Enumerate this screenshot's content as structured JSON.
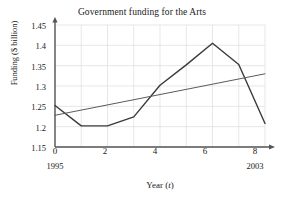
{
  "chart_data": {
    "type": "line",
    "title": "Government funding for the Arts",
    "xlabel": "Year (t)",
    "xlabel_plain": "Year",
    "xlabel_variable": "t",
    "ylabel": "Funding ($ billion)",
    "xlim": [
      0,
      8
    ],
    "ylim": [
      1.15,
      1.45
    ],
    "xticks": [
      0,
      2,
      4,
      6,
      8
    ],
    "xtick_labels": [
      "0",
      "2",
      "4",
      "6",
      "8"
    ],
    "yticks": [
      1.15,
      1.2,
      1.25,
      1.3,
      1.35,
      1.4,
      1.45
    ],
    "ytick_labels": [
      "1.15",
      "1.2",
      "1.25",
      "1.3",
      "1.35",
      "1.4",
      "1.45"
    ],
    "grid": true,
    "grid_x_step": 1,
    "grid_y_step": 0.05,
    "legend": "none",
    "x_axis_annotations": [
      {
        "at": 0,
        "label": "1995"
      },
      {
        "at": 8,
        "label": "2003"
      }
    ],
    "series": [
      {
        "name": "Funding",
        "style": "piecewise-linear",
        "color": "#3a3a3a",
        "x": [
          0,
          1,
          2,
          3,
          4,
          5,
          6,
          7,
          8
        ],
        "values": [
          1.252,
          1.202,
          1.202,
          1.224,
          1.302,
          1.352,
          1.405,
          1.353,
          1.208
        ]
      },
      {
        "name": "Trend line",
        "style": "straight",
        "color": "#5a5a5a",
        "x": [
          0,
          8
        ],
        "values": [
          1.228,
          1.33
        ]
      }
    ]
  },
  "figure": {
    "background": "#ffffff",
    "axis_color": "#555555",
    "grid_color": "#dcdcdc",
    "text_color": "#1a1a1a"
  }
}
